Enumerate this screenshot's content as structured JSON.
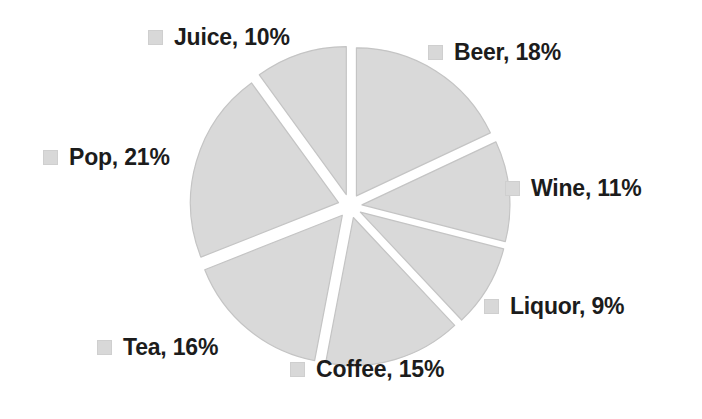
{
  "figure": {
    "background_color": "#ffffff",
    "slice_fill_color": "#d9d9d9",
    "slice_stroke_color": "#c4c4c4",
    "label_text_color": "#1c1c1c",
    "swatch_icon_name": "legend-swatch-icon"
  },
  "chart_data": {
    "type": "pie",
    "title": "",
    "subtitle": "",
    "xlabel": "",
    "ylabel": "",
    "grid": false,
    "legend_position": "none",
    "exploded": true,
    "explode_offset_px": 12,
    "center_px": [
      350,
      206
    ],
    "radius_px": 148,
    "start_angle_deg": 0,
    "direction": "clockwise",
    "categories": [
      "Beer",
      "Wine",
      "Liquor",
      "Coffee",
      "Tea",
      "Pop",
      "Juice"
    ],
    "values": [
      18,
      11,
      9,
      15,
      16,
      21,
      10
    ],
    "units": "percent",
    "labels": [
      {
        "id": "beer",
        "name": "Beer",
        "value": 18,
        "value_text": "18%",
        "text": "Beer, 18%"
      },
      {
        "id": "wine",
        "name": "Wine",
        "value": 11,
        "value_text": "11%",
        "text": "Wine, 11%"
      },
      {
        "id": "liquor",
        "name": "Liquor",
        "value": 9,
        "value_text": "9%",
        "text": "Liquor, 9%"
      },
      {
        "id": "coffee",
        "name": "Coffee",
        "value": 15,
        "value_text": "15%",
        "text": "Coffee, 15%"
      },
      {
        "id": "tea",
        "name": "Tea",
        "value": 16,
        "value_text": "16%",
        "text": "Tea, 16%"
      },
      {
        "id": "pop",
        "name": "Pop",
        "value": 21,
        "value_text": "21%",
        "text": "Pop, 21%"
      },
      {
        "id": "juice",
        "name": "Juice",
        "value": 10,
        "value_text": "10%",
        "text": "Juice, 10%"
      }
    ],
    "slice_angles_deg": [
      {
        "id": "beer",
        "start": 0.0,
        "end": 64.8
      },
      {
        "id": "wine",
        "start": 64.8,
        "end": 104.4
      },
      {
        "id": "liquor",
        "start": 104.4,
        "end": 136.8
      },
      {
        "id": "coffee",
        "start": 136.8,
        "end": 190.8
      },
      {
        "id": "tea",
        "start": 190.8,
        "end": 248.4
      },
      {
        "id": "pop",
        "start": 248.4,
        "end": 324.0
      },
      {
        "id": "juice",
        "start": 324.0,
        "end": 360.0
      }
    ]
  }
}
